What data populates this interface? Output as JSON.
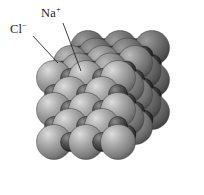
{
  "figure": {
    "background_color": "#ffffff"
  },
  "labels": {
    "sodium": {
      "text": "Na",
      "charge": "+",
      "full": "Na+"
    },
    "chloride": {
      "text": "Cl",
      "charge": "−",
      "full": "Cl−"
    }
  },
  "leaders": [
    {
      "name": "na-leader-line",
      "x1": 63,
      "y1": 23,
      "x2": 81,
      "y2": 71
    },
    {
      "name": "cl-leader-line",
      "x1": 33,
      "y1": 36,
      "x2": 58,
      "y2": 63
    }
  ],
  "ions": {
    "chloride": {
      "role": "anion",
      "radius_px": 17.5,
      "base_color": "#9a9a9a",
      "highlight_color": "#d8d8d8",
      "shadow_color": "#4e4e4e"
    },
    "sodium": {
      "role": "cation",
      "radius_px": 9.5,
      "base_color": "#4a4a4a",
      "highlight_color": "#8d8d8d",
      "shadow_color": "#141414"
    }
  },
  "lattice": {
    "description": "Face-centred cubic rock-salt arrangement, 3 x 3 x 3 block",
    "origin_x": 54,
    "origin_y": 78,
    "step_x": 32,
    "step_y": 32,
    "depth_x": 17,
    "depth_y": -15,
    "dimensions": [
      3,
      3,
      3
    ],
    "shade_by_depth": [
      1.0,
      0.82,
      0.66
    ]
  },
  "chart_data": {
    "type": "diagram",
    "legend": [
      "Na+",
      "Cl−"
    ]
  }
}
